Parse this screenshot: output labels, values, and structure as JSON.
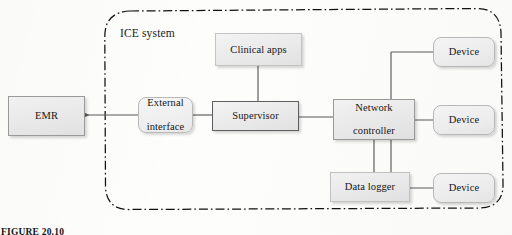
{
  "figure": {
    "boundary_label": "ICE system",
    "caption_prefix": "FIGURE 20.10",
    "caption_rest": ""
  },
  "nodes": {
    "emr": {
      "label": "EMR"
    },
    "external_interface": {
      "line1": "External",
      "line2": "interface"
    },
    "supervisor": {
      "label": "Supervisor"
    },
    "clinical_apps": {
      "label": "Clinical apps"
    },
    "network_controller": {
      "line1": "Network",
      "line2": "controller"
    },
    "data_logger": {
      "label": "Data logger"
    },
    "device_1": {
      "label": "Device"
    },
    "device_2": {
      "label": "Device"
    },
    "device_3": {
      "label": "Device"
    }
  },
  "colors": {
    "ink": "#1b1b1b",
    "box_fill": "#eeeeee",
    "box_border": "#9a9a9a",
    "device_border": "#b9b9b9",
    "wire": "#5a5a5a",
    "boundary": "#111111"
  }
}
